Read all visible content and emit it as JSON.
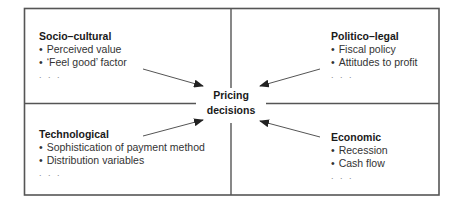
{
  "diagram": {
    "center": {
      "line1": "Pricing",
      "line2": "decisions"
    },
    "quadrants": [
      {
        "position": "top-left",
        "title": "Socio–cultural",
        "items": [
          "Perceived value",
          "‘Feel good’ factor"
        ],
        "more": ". . ."
      },
      {
        "position": "top-right",
        "title": "Politico–legal",
        "items": [
          "Fiscal policy",
          "Attitudes to profit"
        ],
        "more": ". . ."
      },
      {
        "position": "bottom-left",
        "title": "Technological",
        "items": [
          "Sophistication of payment method",
          "Distribution variables"
        ],
        "more": ". . ."
      },
      {
        "position": "bottom-right",
        "title": "Economic",
        "items": [
          "Recession",
          "Cash flow"
        ],
        "more": ". . ."
      }
    ],
    "arrows": [
      {
        "from": "top-left",
        "to": "center"
      },
      {
        "from": "top-right",
        "to": "center"
      },
      {
        "from": "bottom-left",
        "to": "center"
      },
      {
        "from": "bottom-right",
        "to": "center"
      }
    ],
    "colors": {
      "border": "#555555",
      "arrow": "#555555",
      "text": "#222222"
    }
  }
}
